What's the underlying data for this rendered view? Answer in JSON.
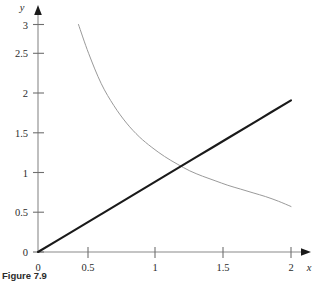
{
  "caption": {
    "text": "Figure 7.9"
  },
  "chart_data": {
    "type": "line",
    "title": "",
    "xlabel": "x",
    "ylabel": "y",
    "xlim": [
      0,
      2.12
    ],
    "ylim": [
      0,
      3.18
    ],
    "grid": false,
    "legend": "none",
    "x_ticks": [
      0,
      0.5,
      1,
      1.5,
      2
    ],
    "x_tick_labels": [
      "0",
      "0.5",
      "1",
      "1.5",
      "2"
    ],
    "y_ticks": [
      0,
      0.5,
      1,
      1.5,
      2,
      2.5,
      3
    ],
    "y_tick_labels": [
      "0",
      "0.5",
      "1",
      "1.5",
      "2",
      "2.5",
      "3"
    ],
    "annotations": [],
    "series": [
      {
        "name": "linear",
        "color": "#1a1a1a",
        "width": 2.1,
        "x": [
          0,
          0.25,
          0.5,
          0.75,
          1,
          1.25,
          1.5,
          1.75,
          2
        ],
        "values": [
          0,
          0.25,
          0.5,
          0.75,
          1,
          1.25,
          1.5,
          1.75,
          2
        ]
      },
      {
        "name": "decaying",
        "color": "#9a9a9a",
        "width": 1.0,
        "x": [
          0.32,
          0.4,
          0.5,
          0.6,
          0.7,
          0.8,
          0.9,
          1.0,
          1.1,
          1.2,
          1.3,
          1.4,
          1.5,
          1.6,
          1.7,
          1.8,
          1.9,
          2.0
        ],
        "values": [
          3.0,
          2.62,
          2.22,
          1.93,
          1.7,
          1.52,
          1.38,
          1.26,
          1.16,
          1.07,
          1.0,
          0.94,
          0.88,
          0.83,
          0.78,
          0.73,
          0.67,
          0.6
        ]
      }
    ]
  }
}
